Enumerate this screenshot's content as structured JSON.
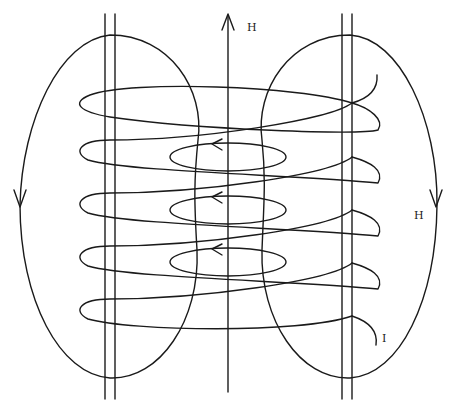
{
  "diagram": {
    "type": "solenoid-magnetic-field",
    "labels": {
      "axis_field": "H",
      "return_field": "H",
      "current": "I"
    },
    "colors": {
      "stroke": "#1a1a1a",
      "background": "#ffffff"
    },
    "coil": {
      "turns": 5,
      "loop_centers_y": [
        103,
        157,
        210,
        263,
        316
      ]
    },
    "inner_field_loops": {
      "count": 3,
      "centers_y": [
        157,
        210,
        262
      ],
      "arrow_direction": "left"
    },
    "return_loops": [
      {
        "side": "left",
        "arrow_direction": "down"
      },
      {
        "side": "right",
        "arrow_direction": "down"
      }
    ],
    "axis_arrow_direction": "up"
  }
}
